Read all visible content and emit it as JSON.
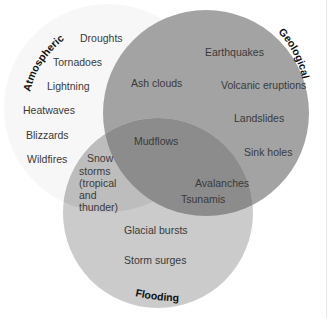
{
  "diagram": {
    "type": "venn",
    "sets": [
      {
        "name": "Atmospheric",
        "color": "#f6f6f6"
      },
      {
        "name": "Geological",
        "color": "#a3a3a3"
      },
      {
        "name": "Flooding",
        "color": "#cbcbcb"
      }
    ],
    "labels": {
      "atmospheric": "Atmospheric",
      "geological": "Geological",
      "flooding": "Flooding"
    },
    "atmospheric_only": [
      "Droughts",
      "Tornadoes",
      "Lightning",
      "Heatwaves",
      "Blizzards",
      "Wildfires"
    ],
    "geological_only": [
      "Earthquakes",
      "Volcanic eruptions",
      "Landslides",
      "Sink holes"
    ],
    "atmospheric_geological": [
      "Ash clouds"
    ],
    "atmospheric_geological_flooding": [
      "Mudflows"
    ],
    "atmospheric_flooding": [
      "Snow",
      "storms",
      "(tropical",
      "and",
      "thunder)"
    ],
    "geological_flooding": [
      "Avalanches",
      "Tsunamis"
    ],
    "flooding_only": [
      "Glacial bursts",
      "Storm surges"
    ],
    "colors": {
      "overlap_geo_flood": "#8c8c8c",
      "overlap_atmo_flood": "#bdbdbd",
      "text": "#3a3a3a",
      "title_text": "#111111"
    }
  }
}
